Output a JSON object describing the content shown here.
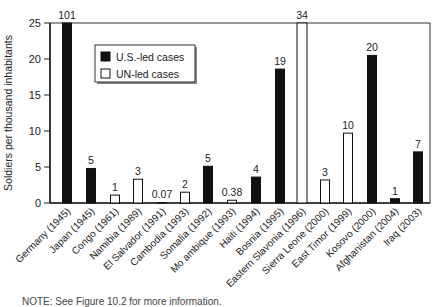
{
  "chart_data": {
    "type": "bar",
    "title": "",
    "xlabel": "",
    "ylabel": "Soldiers per thousand inhabitants",
    "ylim": [
      0,
      25
    ],
    "yticks": [
      0,
      5,
      10,
      15,
      20,
      25
    ],
    "grid": false,
    "legend_position": "upper-left",
    "legend": [
      {
        "name": "U.S.-led cases",
        "fill": "#111111"
      },
      {
        "name": "UN-led cases",
        "fill": "#ffffff"
      }
    ],
    "categories": [
      "Germany (1945)",
      "Japan (1945)",
      "Congo (1961)",
      "Namibia (1989)",
      "El Salvador (1991)",
      "Cambodia (1993)",
      "Somalia (1992)",
      "Mo ambique (1993)",
      "Haiti (1994)",
      "Bosnia (1995)",
      "Eastern Slavonia (1996)",
      "Sierra Leone (2000)",
      "East Timor (1999)",
      "Kosovo (2000)",
      "Afghanistan (2004)",
      "Iraq (2003)"
    ],
    "values": [
      101,
      4.8,
      1.1,
      3.3,
      0.07,
      1.5,
      5.1,
      0.38,
      3.6,
      18.6,
      34,
      3.2,
      9.7,
      20.5,
      0.6,
      7.1
    ],
    "labels": [
      "101",
      "5",
      "1",
      "3",
      "0.07",
      "2",
      "5",
      "0.38",
      "4",
      "19",
      "34",
      "3",
      "10",
      "20",
      "1",
      "7"
    ],
    "led_by": [
      "US",
      "US",
      "UN",
      "UN",
      "UN",
      "UN",
      "US",
      "UN",
      "US",
      "US",
      "UN",
      "UN",
      "UN",
      "US",
      "US",
      "US"
    ],
    "clipped": [
      true,
      false,
      false,
      false,
      false,
      false,
      false,
      false,
      false,
      false,
      true,
      false,
      false,
      false,
      false,
      false
    ]
  },
  "note": "NOTE: See Figure 10.2 for more information."
}
